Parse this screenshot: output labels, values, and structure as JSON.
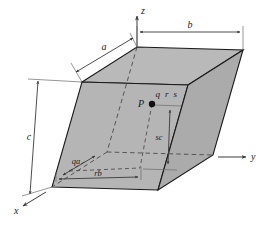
{
  "figure": {
    "type": "crystallographic-unit-cell-diagram",
    "background_color": "#ffffff",
    "face_fill_color": "#b5b5b5",
    "face_fill_color_light": "#c2c2c2",
    "line_color": "#1a1a1a",
    "dash_color": "#555555"
  },
  "axes": [
    {
      "id": "z",
      "label": "z",
      "direction": "up"
    },
    {
      "id": "y",
      "label": "y",
      "direction": "right"
    },
    {
      "id": "x",
      "label": "x",
      "direction": "down-left"
    }
  ],
  "edge_dimensions": [
    {
      "id": "a",
      "label": "a",
      "edge": "top-left-oblique"
    },
    {
      "id": "b",
      "label": "b",
      "edge": "top-rear-horizontal"
    },
    {
      "id": "c",
      "label": "c",
      "edge": "left-vertical"
    }
  ],
  "point": {
    "name": "P",
    "label": "P",
    "coordinate_label": "q r s",
    "coordinates": [
      "q",
      "r",
      "s"
    ]
  },
  "projection_dimensions": [
    {
      "id": "qa",
      "label": "qa",
      "along_axis": "x",
      "fraction_of": "a"
    },
    {
      "id": "rb",
      "label": "rb",
      "along_axis": "y",
      "fraction_of": "b"
    },
    {
      "id": "sc",
      "label": "sc",
      "along_axis": "z",
      "fraction_of": "c"
    }
  ]
}
